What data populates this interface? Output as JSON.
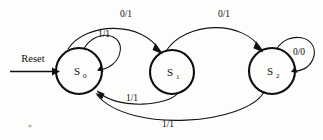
{
  "diagram": {
    "type": "finite-state-machine",
    "background_color": "#fdfdfb",
    "stroke_color": "#131313",
    "reset": {
      "label": "Reset",
      "target": "S0"
    },
    "states": [
      {
        "id": "S0",
        "letter": "S",
        "subscript": "0",
        "cx": 79,
        "cy": 71,
        "r": 23
      },
      {
        "id": "S1",
        "letter": "S",
        "subscript": "1",
        "cx": 172,
        "cy": 72,
        "r": 22
      },
      {
        "id": "S2",
        "letter": "S",
        "subscript": "2",
        "cx": 272,
        "cy": 71,
        "r": 23
      }
    ],
    "transitions": [
      {
        "id": "t0",
        "from": "S0",
        "to": "S1",
        "label": "0/1",
        "label_x": 126,
        "label_y": 17,
        "position": "top-left-arc"
      },
      {
        "id": "t1",
        "from": "S1",
        "to": "S2",
        "label": "0/1",
        "label_x": 224,
        "label_y": 17,
        "position": "top-right-arc"
      },
      {
        "id": "t2",
        "from": "S0",
        "to": "S0",
        "label": "1/1",
        "label_x": 104,
        "label_y": 37,
        "position": "self-loop-left"
      },
      {
        "id": "t3",
        "from": "S2",
        "to": "S2",
        "label": "0/0",
        "label_x": 299,
        "label_y": 55,
        "position": "self-loop-right"
      },
      {
        "id": "t4",
        "from": "S1",
        "to": "S0",
        "label": "1/1",
        "label_x": 132,
        "label_y": 101,
        "position": "bottom-inner-arc"
      },
      {
        "id": "t5",
        "from": "S2",
        "to": "S0",
        "label": "1/1",
        "label_x": 168,
        "label_y": 127,
        "position": "bottom-outer-arc"
      }
    ]
  }
}
